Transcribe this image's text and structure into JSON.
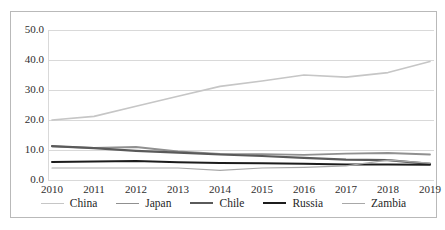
{
  "chart_data": {
    "type": "line",
    "title": "",
    "xlabel": "",
    "ylabel": "",
    "x": [
      "2010",
      "2011",
      "2012",
      "2013",
      "2014",
      "2015",
      "2016",
      "2017",
      "2018",
      "2019"
    ],
    "categories": [
      "2010",
      "2011",
      "2012",
      "2013",
      "2014",
      "2015",
      "2016",
      "2017",
      "2018",
      "2019"
    ],
    "ylim": [
      0,
      50
    ],
    "yticks": [
      "0.0",
      "10.0",
      "20.0",
      "30.0",
      "40.0",
      "50.0"
    ],
    "ytick_values": [
      0,
      10,
      20,
      30,
      40,
      50
    ],
    "grid": true,
    "legend_position": "bottom",
    "series": [
      {
        "name": "China",
        "color": "#c6c6c6",
        "width": 1.6,
        "values": [
          20.0,
          21.2,
          24.6,
          27.9,
          31.2,
          33.0,
          35.0,
          34.3,
          35.8,
          39.5
        ]
      },
      {
        "name": "Japan",
        "color": "#909090",
        "width": 1.8,
        "values": [
          11.2,
          10.7,
          11.0,
          9.5,
          8.7,
          8.6,
          8.4,
          8.8,
          9.0,
          8.5
        ]
      },
      {
        "name": "Chile",
        "color": "#5a5a5a",
        "width": 2.2,
        "values": [
          11.3,
          10.6,
          9.7,
          9.1,
          8.5,
          8.0,
          7.4,
          6.8,
          6.6,
          5.4
        ]
      },
      {
        "name": "Russia",
        "color": "#1c1c1c",
        "width": 2.0,
        "values": [
          6.0,
          6.2,
          6.3,
          5.9,
          5.7,
          5.6,
          5.4,
          5.2,
          5.2,
          5.1
        ]
      },
      {
        "name": "Zambia",
        "color": "#a8a8a8",
        "width": 1.2,
        "values": [
          4.0,
          4.0,
          4.0,
          4.0,
          3.2,
          4.0,
          4.2,
          4.7,
          6.6,
          5.6
        ]
      }
    ]
  },
  "axis": {
    "y_ticks": [
      "50.0",
      "40.0",
      "30.0",
      "20.0",
      "10.0",
      "0.0"
    ],
    "x_ticks": [
      "2010",
      "2011",
      "2012",
      "2013",
      "2014",
      "2015",
      "2016",
      "2017",
      "2018",
      "2019"
    ]
  },
  "legend": {
    "items": [
      {
        "label": "China"
      },
      {
        "label": "Japan"
      },
      {
        "label": "Chile"
      },
      {
        "label": "Russia"
      },
      {
        "label": "Zambia"
      }
    ]
  }
}
